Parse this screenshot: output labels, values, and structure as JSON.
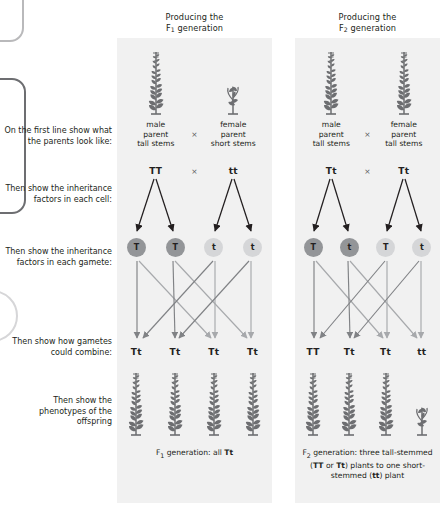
{
  "instructions": [
    {
      "id": "parents",
      "text": "On the first line show what the parents look like:"
    },
    {
      "id": "factors",
      "text": "Then show the inheritance factors in each cell:"
    },
    {
      "id": "gametes",
      "text": "Then show the inheritance factors in each gamete:"
    },
    {
      "id": "combine",
      "text": "Then show how gametes could combine:"
    },
    {
      "id": "phenotype",
      "text": "Then show the phenotypes of the offspring"
    }
  ],
  "panels": [
    {
      "id": "f1",
      "header_line1": "Producing the",
      "header_generation": "F",
      "header_subscript": "1",
      "header_line2": "generation",
      "parents": [
        {
          "sex": "male",
          "label_line1": "male",
          "label_line2": "parent",
          "label_line3": "tall stems",
          "plant": "tall"
        },
        {
          "sex": "female",
          "label_line1": "female",
          "label_line2": "parent",
          "label_line3": "short stems",
          "plant": "short"
        }
      ],
      "cross_symbol": "×",
      "parent_genotypes": [
        "TT",
        "tt"
      ],
      "gametes": [
        {
          "allele": "T",
          "shade": "dark"
        },
        {
          "allele": "T",
          "shade": "dark"
        },
        {
          "allele": "t",
          "shade": "light"
        },
        {
          "allele": "t",
          "shade": "light"
        }
      ],
      "offspring_genotypes": [
        "Tt",
        "Tt",
        "Tt",
        "Tt"
      ],
      "offspring_plants": [
        "tall",
        "tall",
        "tall",
        "tall"
      ],
      "caption_html": "F<sub>1</sub> generation: all <b>Tt</b>"
    },
    {
      "id": "f2",
      "header_line1": "Producing the",
      "header_generation": "F",
      "header_subscript": "2",
      "header_line2": "generation",
      "parents": [
        {
          "sex": "male",
          "label_line1": "male",
          "label_line2": "parent",
          "label_line3": "tall stems",
          "plant": "tall"
        },
        {
          "sex": "female",
          "label_line1": "female",
          "label_line2": "parent",
          "label_line3": "tall stems",
          "plant": "tall"
        }
      ],
      "cross_symbol": "×",
      "parent_genotypes": [
        "Tt",
        "Tt"
      ],
      "gametes": [
        {
          "allele": "T",
          "shade": "dark"
        },
        {
          "allele": "t",
          "shade": "dark"
        },
        {
          "allele": "T",
          "shade": "light"
        },
        {
          "allele": "t",
          "shade": "light"
        }
      ],
      "offspring_genotypes": [
        "TT",
        "Tt",
        "Tt",
        "tt"
      ],
      "offspring_plants": [
        "tall",
        "tall",
        "tall",
        "short"
      ],
      "caption_html": "F<sub>2</sub> generation: three tall-stemmed (<b>TT</b> or <b>Tt</b>) plants to one short-stemmed (<b>tt</b>) plant"
    }
  ],
  "colors": {
    "panel_background": "#f1f1f1",
    "gamete_dark": "#939598",
    "gamete_light": "#d5d6d8",
    "text": "#231f20",
    "arrow_dark": "#231f20",
    "line_gray": "#a7a9ac"
  }
}
